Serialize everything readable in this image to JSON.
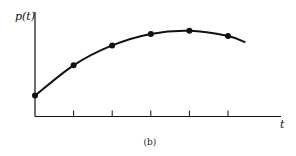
{
  "chart_data": {
    "type": "line",
    "title": "",
    "caption": "(b)",
    "xlabel": "t",
    "ylabel": "p(t)",
    "x_tick_labels": [],
    "y_tick_labels": [],
    "x": [
      0,
      1,
      2,
      3,
      4,
      5
    ],
    "series": [
      {
        "name": "p(t)",
        "values": [
          0.2,
          0.49,
          0.68,
          0.79,
          0.82,
          0.77
        ],
        "markers": true
      }
    ],
    "curve_extends_to_x": 5.45,
    "curve_end_value": 0.71,
    "xlim": [
      0,
      6.4
    ],
    "ylim": [
      0,
      1
    ],
    "grid": false,
    "legend": "none",
    "x_ticks_count": 5
  },
  "labels": {
    "y_axis": "p(t)",
    "x_axis": "t",
    "caption": "(b)"
  },
  "colors": {
    "ink": "#111111",
    "background": "#ffffff"
  }
}
